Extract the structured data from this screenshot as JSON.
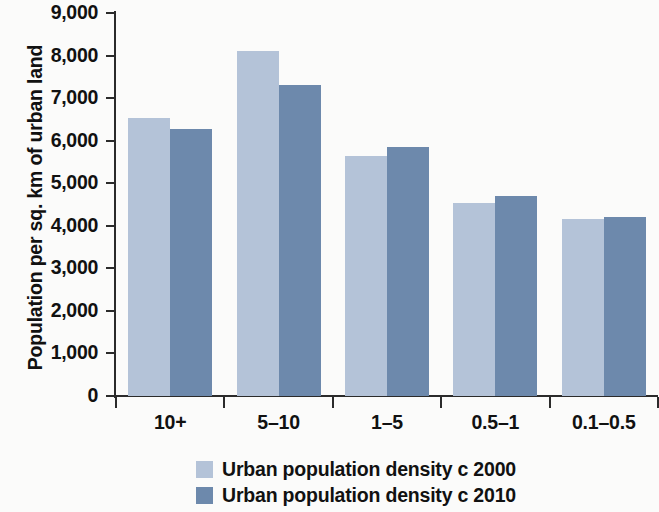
{
  "chart_data": {
    "type": "bar",
    "title": "",
    "subtitle": "",
    "xlabel": "",
    "ylabel": "Population per sq. km of urban land",
    "categories": [
      "10+",
      "5–10",
      "1–5",
      "0.5–1",
      "0.1–0.5"
    ],
    "series": [
      {
        "name": "Urban population density c 2000",
        "color": "#b4c3d8",
        "values": [
          6530,
          8100,
          5650,
          4530,
          4150
        ]
      },
      {
        "name": "Urban population density c 2010",
        "color": "#6d89ac",
        "values": [
          6280,
          7300,
          5850,
          4700,
          4200
        ]
      }
    ],
    "ylim": [
      0,
      9000
    ],
    "ytick_values": [
      0,
      1000,
      2000,
      3000,
      4000,
      5000,
      6000,
      7000,
      8000,
      9000
    ],
    "ytick_labels": [
      "0",
      "1,000",
      "2,000",
      "3,000",
      "4,000",
      "5,000",
      "6,000",
      "7,000",
      "8,000",
      "9,000"
    ],
    "grid": false,
    "legend_position": "bottom-center"
  },
  "legend": {
    "items": [
      {
        "label": "Urban population density c 2000",
        "color": "#b4c3d8"
      },
      {
        "label": "Urban population density c 2010",
        "color": "#6d89ac"
      }
    ]
  },
  "colors": {
    "series_2000": "#b4c3d8",
    "series_2010": "#6d89ac",
    "axis": "#2b2b2b",
    "background": "#fbfbfa",
    "text": "#111111"
  }
}
